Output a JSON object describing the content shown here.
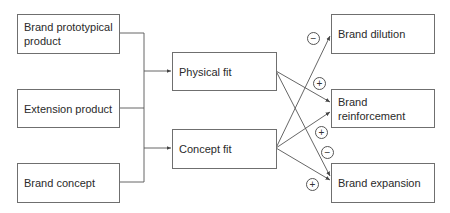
{
  "diagram": {
    "inputs": [
      {
        "id": "brand_prototypical_product",
        "label": "Brand prototypical product"
      },
      {
        "id": "extension_product",
        "label": "Extension product"
      },
      {
        "id": "brand_concept",
        "label": "Brand concept"
      }
    ],
    "fits": [
      {
        "id": "physical_fit",
        "label": "Physical fit"
      },
      {
        "id": "concept_fit",
        "label": "Concept fit"
      }
    ],
    "outcomes": [
      {
        "id": "brand_dilution",
        "label": "Brand dilution"
      },
      {
        "id": "brand_reinforcement",
        "label": "Brand reinforcement"
      },
      {
        "id": "brand_expansion",
        "label": "Brand expansion"
      }
    ],
    "edges": [
      {
        "from": "inputs (all three, merged)",
        "to": "physical_fit",
        "sign": ""
      },
      {
        "from": "inputs (all three, merged)",
        "to": "concept_fit",
        "sign": ""
      },
      {
        "from": "physical_fit",
        "to": "brand_reinforcement",
        "sign": "+"
      },
      {
        "from": "physical_fit",
        "to": "brand_expansion",
        "sign": "−"
      },
      {
        "from": "concept_fit",
        "to": "brand_dilution",
        "sign": "−"
      },
      {
        "from": "concept_fit",
        "to": "brand_reinforcement",
        "sign": "+"
      },
      {
        "from": "concept_fit",
        "to": "brand_expansion",
        "sign": "+"
      }
    ],
    "signs": [
      "−",
      "+",
      "+",
      "−",
      "+"
    ]
  },
  "colors": {
    "line": "#555555",
    "border": "#6f6f6f",
    "text": "#2a2a2a"
  }
}
